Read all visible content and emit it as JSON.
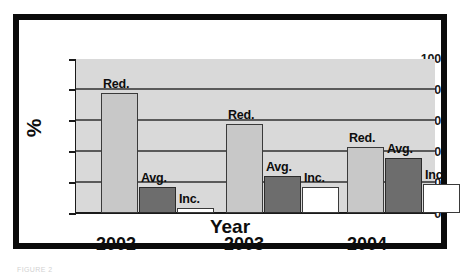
{
  "chart_data": {
    "type": "bar",
    "title": "",
    "xlabel": "Year",
    "ylabel": "%",
    "categories": [
      "2002",
      "2003",
      "2004"
    ],
    "series": [
      {
        "name": "Red.",
        "values": [
          78,
          58,
          43
        ],
        "color": "#c8c8c8"
      },
      {
        "name": "Avg.",
        "values": [
          17,
          24,
          36
        ],
        "color": "#6d6d6d"
      },
      {
        "name": "Inc.",
        "values": [
          3,
          17,
          19
        ],
        "color": "#ffffff"
      }
    ],
    "ylim": [
      0,
      100
    ],
    "yticks": [
      0,
      20,
      40,
      60,
      80,
      100
    ],
    "ytick_labels": [
      "0",
      "20",
      "40",
      "60",
      "80",
      "100"
    ],
    "gridlines": [
      20,
      40,
      60,
      80
    ],
    "grid": true,
    "legend": "none",
    "bar_labels": [
      "Red.",
      "Avg.",
      "Inc.",
      "Red.",
      "Avg.",
      "Inc.",
      "Red.",
      "Avg.",
      "Inc."
    ],
    "plot_background": "#d9d9d9",
    "frame_color": "#0b0b0b"
  },
  "axis": {
    "y_title": "%",
    "x_title": "Year",
    "y_ticks": [
      "100",
      "80",
      "60",
      "40",
      "20",
      "0"
    ],
    "x_ticks": [
      "2002",
      "2003",
      "2004"
    ]
  },
  "caption": {
    "remnant": "FIGURE 2"
  }
}
